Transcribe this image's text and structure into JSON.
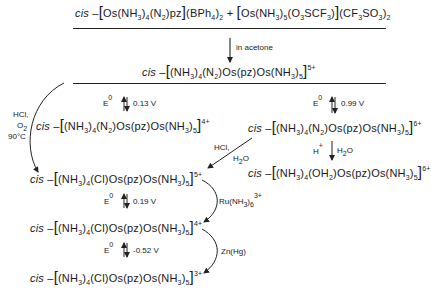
{
  "scheme": {
    "reactants": {
      "prefix": "cis",
      "reactant1": "[Os(NH3)4(N2)pz](BPh4)2",
      "plus": "+",
      "reactant2": "[Os(NH3)5(O3SCF3)](CF3SO3)2"
    },
    "step_in_acetone": {
      "label": "in acetone"
    },
    "product_5plus_N2": {
      "prefix": "cis",
      "formula": "[(NH3)4(N2)Os(pz)Os(NH3)5]",
      "charge": "5+"
    },
    "e0_013": {
      "symbol": "E0",
      "value": "0.13 V"
    },
    "product_4plus_N2": {
      "prefix": "cis",
      "formula": "[(NH3)4(N2)Os(pz)Os(NH3)5]",
      "charge": "4+"
    },
    "e0_099": {
      "symbol": "E0",
      "value": "0.99 V"
    },
    "product_6plus_N2": {
      "prefix": "cis",
      "formula": "[(NH3)4(N2)Os(pz)Os(NH3)5]",
      "charge": "6+"
    },
    "step_h_h2o": {
      "left": "H+",
      "right": "H2O"
    },
    "product_6plus_OH2": {
      "prefix": "cis",
      "formula": "[(NH3)4(OH2)Os(pz)Os(NH3)5]",
      "charge": "6+"
    },
    "step_hcl_h2o": {
      "line1": "HCl,",
      "line2": "H2O"
    },
    "step_hcl_o2": {
      "line1": "HCl,",
      "line2": "O2",
      "line3": "90°C"
    },
    "product_5plus_Cl": {
      "prefix": "cis",
      "formula": "[(NH3)4(Cl)Os(pz)Os(NH3)5]",
      "charge": "5+"
    },
    "e0_019": {
      "symbol": "E0",
      "value": "0.19 V"
    },
    "step_ru": {
      "label": "Ru(NH3)6 3+"
    },
    "product_4plus_Cl": {
      "prefix": "cis",
      "formula": "[(NH3)4(Cl)Os(pz)Os(NH3)5]",
      "charge": "4+"
    },
    "e0_052": {
      "symbol": "E0",
      "value": "-0.52 V"
    },
    "step_zn": {
      "label": "Zn(Hg)"
    },
    "product_3plus_Cl": {
      "prefix": "cis",
      "formula": "[(NH3)4(Cl)Os(pz)Os(NH3)5]",
      "charge": "3+"
    }
  }
}
